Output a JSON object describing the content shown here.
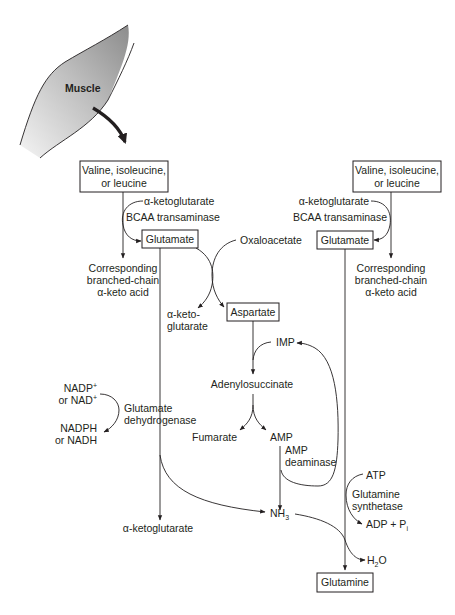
{
  "diagram": {
    "tissue": {
      "label": "Muscle",
      "fill_gradient": [
        "#8e8e8e",
        "#f2f2f2"
      ]
    },
    "left_branch": {
      "bcaa_box": [
        "Valine, isoleucine,",
        "or leucine"
      ],
      "cosubstrate": "α-ketoglutarate",
      "enzyme": "BCAA transaminase",
      "product_box": "Glutamate",
      "byproduct": [
        "Corresponding",
        "branched-chain",
        "α-keto acid"
      ]
    },
    "right_branch": {
      "bcaa_box": [
        "Valine, isoleucine,",
        "or leucine"
      ],
      "cosubstrate": "α-ketoglutarate",
      "enzyme": "BCAA transaminase",
      "product_box": "Glutamate",
      "byproduct": [
        "Corresponding",
        "branched-chain",
        "α-keto acid"
      ]
    },
    "transamination": {
      "oxaloacetate": "Oxaloacetate",
      "alpha_kg_out": [
        "α-keto-",
        "glutarate"
      ],
      "aspartate_box": "Aspartate"
    },
    "purine_cycle": {
      "imp": "IMP",
      "adenylosuccinate": "Adenylosuccinate",
      "fumarate": "Fumarate",
      "amp": "AMP",
      "enzyme": [
        "AMP",
        "deaminase"
      ]
    },
    "glutamate_dehydrogenase": {
      "cofactor_in": [
        "NADP",
        "or NAD"
      ],
      "cofactor_in_sup": "+",
      "cofactor_out": [
        "NADPH",
        "or NADH"
      ],
      "enzyme": [
        "Glutamate",
        "dehydrogenase"
      ],
      "product": "α-ketoglutarate"
    },
    "ammonia": {
      "label": "NH",
      "subscript": "3"
    },
    "glutamine_synthetase": {
      "atp": "ATP",
      "enzyme": [
        "Glutamine",
        "synthetase"
      ],
      "adp": "ADP + P",
      "adp_subscript": "i",
      "water": "H",
      "water_subscript": "2",
      "water_tail": "O",
      "product_box": "Glutamine"
    }
  }
}
